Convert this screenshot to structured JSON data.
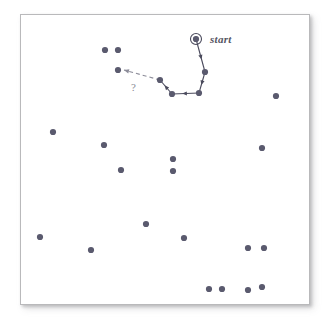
{
  "figure": {
    "background_color": "#ffffff",
    "frame": {
      "x": 20,
      "y": 14,
      "width": 290,
      "height": 291,
      "border_color": "#b9b9bb",
      "fill": "#ffffff"
    },
    "dot_color": "#5a5a6e",
    "path_color": "#4a4a5c",
    "dashed_color": "#8c8c99"
  },
  "annotations": {
    "start_label": "start",
    "start_label_pos": {
      "x": 210,
      "y": 33
    },
    "question_label": "?",
    "question_label_pos": {
      "x": 131,
      "y": 81
    },
    "start_marker": {
      "x": 196,
      "y": 39,
      "ring_radius": 5.5,
      "dot_radius": 2.6
    }
  },
  "chart_data": {
    "type": "scatter",
    "title": "",
    "xlabel": "",
    "ylabel": "",
    "grid": false,
    "legend": null,
    "xlim": [
      20,
      310
    ],
    "ylim": [
      14,
      305
    ],
    "points": [
      {
        "x": 105,
        "y": 50
      },
      {
        "x": 118,
        "y": 50
      },
      {
        "x": 118,
        "y": 70
      },
      {
        "x": 160,
        "y": 80
      },
      {
        "x": 172,
        "y": 94
      },
      {
        "x": 199,
        "y": 93
      },
      {
        "x": 205,
        "y": 72
      },
      {
        "x": 196,
        "y": 39
      },
      {
        "x": 276,
        "y": 96
      },
      {
        "x": 53,
        "y": 132
      },
      {
        "x": 104,
        "y": 145
      },
      {
        "x": 262,
        "y": 148
      },
      {
        "x": 173,
        "y": 159
      },
      {
        "x": 121,
        "y": 170
      },
      {
        "x": 173,
        "y": 171
      },
      {
        "x": 146,
        "y": 224
      },
      {
        "x": 40,
        "y": 237
      },
      {
        "x": 184,
        "y": 238
      },
      {
        "x": 91,
        "y": 250
      },
      {
        "x": 248,
        "y": 248
      },
      {
        "x": 264,
        "y": 248
      },
      {
        "x": 209,
        "y": 289
      },
      {
        "x": 222,
        "y": 289
      },
      {
        "x": 248,
        "y": 290
      },
      {
        "x": 262,
        "y": 287
      }
    ],
    "path": {
      "style": "solid-with-arrows",
      "vertices": [
        {
          "x": 196,
          "y": 39
        },
        {
          "x": 205,
          "y": 72
        },
        {
          "x": 199,
          "y": 93
        },
        {
          "x": 172,
          "y": 94
        },
        {
          "x": 160,
          "y": 80
        }
      ]
    },
    "dashed_path": {
      "style": "dashed-with-arrow",
      "vertices": [
        {
          "x": 160,
          "y": 80
        },
        {
          "x": 124,
          "y": 70
        }
      ]
    }
  }
}
